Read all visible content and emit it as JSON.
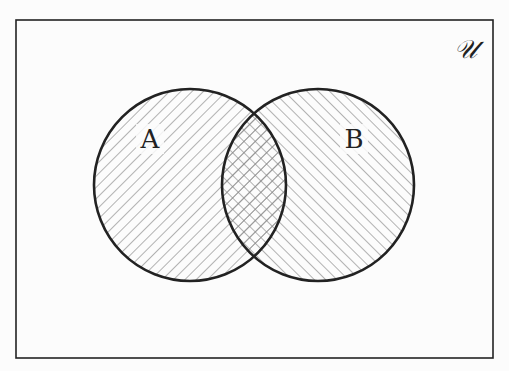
{
  "diagram": {
    "type": "venn",
    "universe_label": "𝒰",
    "sets": [
      {
        "name": "A",
        "label": "A",
        "hatch": "forward-diagonal"
      },
      {
        "name": "B",
        "label": "B",
        "hatch": "backward-diagonal"
      }
    ],
    "intersection": {
      "hatch": "crosshatch"
    },
    "colors": {
      "stroke": "#222222",
      "hatch": "#8a8a8a",
      "background": "#fcfcfc"
    }
  }
}
